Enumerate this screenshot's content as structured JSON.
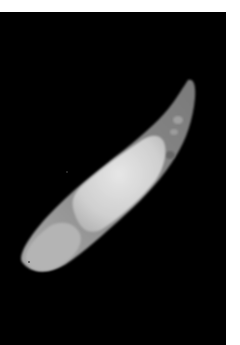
{
  "image": {
    "description": "Grayscale micrograph of an elongated curved specimen on black background",
    "colors": {
      "page_background": "#ffffff",
      "photo_background": "#000000",
      "outer_body": "#8a8a8a",
      "inner_body": "#d6d6d6",
      "tip": "#9a9a9a"
    }
  }
}
